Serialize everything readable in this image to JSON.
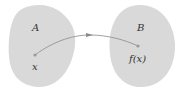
{
  "diagram": {
    "type": "function-mapping",
    "colors": {
      "set_fill": "#d9d9d9",
      "arrow": "#8a8a8a",
      "point": "#9a9a9a",
      "text": "#333333"
    },
    "sets": [
      {
        "id": "A",
        "label": "A"
      },
      {
        "id": "B",
        "label": "B"
      }
    ],
    "points": [
      {
        "set": "A",
        "label": "x"
      },
      {
        "set": "B",
        "label": "f(x)"
      }
    ],
    "mapping": {
      "from": "x",
      "to": "f(x)"
    }
  }
}
